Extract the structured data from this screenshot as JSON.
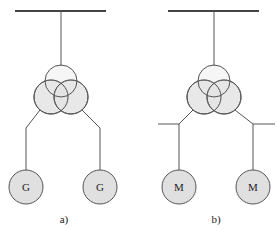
{
  "figure": {
    "panels": [
      {
        "id": "a",
        "caption": "a)",
        "machine_label_left": "G",
        "machine_label_right": "G",
        "machine_type": "generator"
      },
      {
        "id": "b",
        "caption": "b)",
        "machine_label_left": "M",
        "machine_label_right": "M",
        "machine_type": "motor"
      }
    ],
    "colors": {
      "line": "#555555",
      "fill": "#e0e0e0",
      "background": "#ffffff"
    }
  }
}
